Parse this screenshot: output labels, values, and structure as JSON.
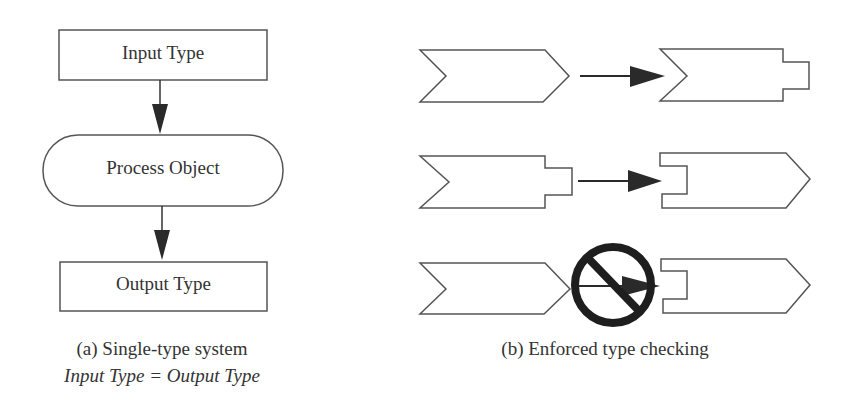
{
  "panel_a": {
    "input_box": "Input Type",
    "process": "Process Object",
    "output_box": "Output Type",
    "caption": "(a) Single-type system",
    "subcaption": "Input Type = Output Type"
  },
  "panel_b": {
    "rows": [
      {
        "from": "chevron",
        "to": "chevron-with-tab",
        "allowed": true
      },
      {
        "from": "chevron-with-tab",
        "to": "slotted-arrow",
        "allowed": true
      },
      {
        "from": "chevron",
        "to": "slotted-arrow",
        "allowed": false
      }
    ],
    "caption": "(b) Enforced type checking"
  },
  "colors": {
    "stroke": "#555555",
    "arrow": "#2a2a2a",
    "prohibit": "#1e1e1e"
  }
}
